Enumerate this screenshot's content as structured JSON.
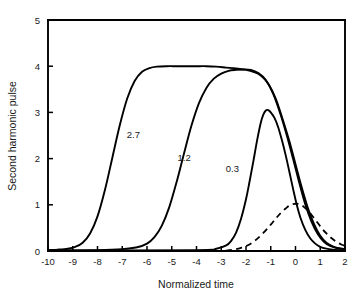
{
  "chart_data": {
    "type": "line",
    "title": "",
    "xlabel": "Normalized time",
    "ylabel": "Second harmonic pulse",
    "xlim": [
      -10,
      2
    ],
    "ylim": [
      0,
      5
    ],
    "grid": false,
    "legend_position": "inline-curve-labels",
    "xticks": [
      "-10",
      "-9",
      "-8",
      "-7",
      "-6",
      "-5",
      "-4",
      "-3",
      "-2",
      "-1",
      "0",
      "1",
      "2"
    ],
    "xtick_values": [
      -10,
      -9,
      -8,
      -7,
      -6,
      -5,
      -4,
      -3,
      -2,
      -1,
      0,
      1,
      2
    ],
    "yticks": [
      "0",
      "1",
      "2",
      "3",
      "4",
      "5"
    ],
    "ytick_values": [
      0,
      1,
      2,
      3,
      4,
      5
    ],
    "series": [
      {
        "name": "2.7",
        "label": "2.7",
        "style": "solid",
        "color": "#000000",
        "annotation_x": -6.55,
        "annotation_y": 2.45,
        "x": [
          -10.0,
          -9.6,
          -9.2,
          -8.9,
          -8.6,
          -8.3,
          -8.0,
          -7.7,
          -7.4,
          -7.1,
          -6.8,
          -6.5,
          -6.2,
          -5.9,
          -5.6,
          -5.2,
          -4.8,
          -4.4,
          -4.0,
          -3.6,
          -3.2,
          -2.8,
          -2.4,
          -2.0,
          -1.7,
          -1.4,
          -1.1,
          -0.8,
          -0.5,
          -0.25,
          0.0,
          0.25,
          0.5,
          0.75,
          1.0,
          1.25,
          1.5,
          1.75,
          2.0
        ],
        "y": [
          0.02,
          0.03,
          0.05,
          0.09,
          0.18,
          0.38,
          0.75,
          1.32,
          2.02,
          2.72,
          3.3,
          3.68,
          3.88,
          3.96,
          3.99,
          4.0,
          4.0,
          4.0,
          4.0,
          4.0,
          3.99,
          3.97,
          3.95,
          3.92,
          3.88,
          3.8,
          3.62,
          3.3,
          2.82,
          2.38,
          1.88,
          1.38,
          0.93,
          0.58,
          0.33,
          0.18,
          0.1,
          0.06,
          0.04
        ]
      },
      {
        "name": "1.2",
        "label": "1.2",
        "style": "solid",
        "color": "#000000",
        "annotation_x": -4.5,
        "annotation_y": 1.95,
        "x": [
          -10.0,
          -8.0,
          -7.0,
          -6.4,
          -6.0,
          -5.7,
          -5.4,
          -5.1,
          -4.8,
          -4.5,
          -4.2,
          -3.9,
          -3.6,
          -3.3,
          -3.0,
          -2.7,
          -2.4,
          -2.1,
          -1.8,
          -1.5,
          -1.2,
          -0.9,
          -0.6,
          -0.35,
          -0.1,
          0.15,
          0.4,
          0.65,
          0.9,
          1.15,
          1.4,
          1.7,
          2.0
        ],
        "y": [
          0.01,
          0.02,
          0.04,
          0.08,
          0.16,
          0.3,
          0.55,
          0.95,
          1.5,
          2.12,
          2.72,
          3.2,
          3.53,
          3.73,
          3.84,
          3.9,
          3.92,
          3.93,
          3.92,
          3.85,
          3.7,
          3.4,
          2.95,
          2.5,
          2.0,
          1.48,
          1.0,
          0.63,
          0.37,
          0.2,
          0.11,
          0.06,
          0.03
        ]
      },
      {
        "name": "0.3",
        "label": "0.3",
        "style": "solid",
        "color": "#000000",
        "annotation_x": -2.55,
        "annotation_y": 1.72,
        "x": [
          -10.0,
          -4.0,
          -3.2,
          -2.8,
          -2.6,
          -2.4,
          -2.2,
          -2.0,
          -1.85,
          -1.7,
          -1.55,
          -1.4,
          -1.3,
          -1.2,
          -1.1,
          -1.0,
          -0.85,
          -0.7,
          -0.55,
          -0.4,
          -0.25,
          -0.1,
          0.05,
          0.2,
          0.4,
          0.6,
          0.8,
          1.0,
          1.25,
          1.5,
          1.75,
          2.0
        ],
        "y": [
          0.01,
          0.02,
          0.05,
          0.12,
          0.22,
          0.4,
          0.7,
          1.12,
          1.52,
          1.95,
          2.4,
          2.78,
          2.95,
          3.04,
          3.05,
          3.0,
          2.88,
          2.68,
          2.4,
          2.08,
          1.72,
          1.35,
          1.0,
          0.72,
          0.45,
          0.27,
          0.16,
          0.09,
          0.05,
          0.03,
          0.02,
          0.02
        ]
      },
      {
        "name": "fundamental-dashed",
        "label": "",
        "style": "dashed",
        "color": "#000000",
        "peak_x": 0.1,
        "peak_y": 1.02,
        "x": [
          -10.0,
          -3.2,
          -2.8,
          -2.5,
          -2.2,
          -1.9,
          -1.6,
          -1.3,
          -1.0,
          -0.8,
          -0.6,
          -0.4,
          -0.2,
          0.0,
          0.1,
          0.25,
          0.45,
          0.65,
          0.85,
          1.05,
          1.25,
          1.45,
          1.65,
          1.85,
          2.0
        ],
        "y": [
          0.0,
          0.0,
          0.01,
          0.03,
          0.07,
          0.13,
          0.24,
          0.39,
          0.57,
          0.7,
          0.82,
          0.92,
          1.0,
          1.02,
          1.02,
          0.99,
          0.9,
          0.78,
          0.64,
          0.5,
          0.38,
          0.28,
          0.2,
          0.14,
          0.11
        ]
      }
    ]
  },
  "axes": {
    "x_axis_title": "Normalized time",
    "y_axis_title": "Second harmonic pulse"
  }
}
